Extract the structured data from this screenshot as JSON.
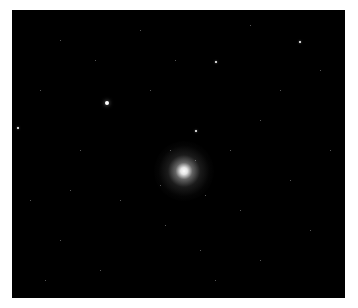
{
  "image": {
    "subject": "globular star cluster in dark sky field",
    "background_color": "#000000",
    "frame_color": "#ffffff",
    "cluster_center": [
      184,
      171
    ],
    "bright_stars": [
      {
        "x": 107,
        "y": 103,
        "size": 4
      },
      {
        "x": 196,
        "y": 131,
        "size": 2
      },
      {
        "x": 216,
        "y": 62,
        "size": 2
      },
      {
        "x": 300,
        "y": 42,
        "size": 2
      },
      {
        "x": 18,
        "y": 128,
        "size": 2
      }
    ],
    "faint_stars": [
      [
        60,
        40
      ],
      [
        140,
        30
      ],
      [
        250,
        25
      ],
      [
        320,
        70
      ],
      [
        40,
        90
      ],
      [
        80,
        150
      ],
      [
        120,
        200
      ],
      [
        60,
        240
      ],
      [
        100,
        270
      ],
      [
        200,
        250
      ],
      [
        240,
        210
      ],
      [
        290,
        180
      ],
      [
        310,
        230
      ],
      [
        260,
        120
      ],
      [
        230,
        150
      ],
      [
        150,
        90
      ],
      [
        70,
        190
      ],
      [
        30,
        200
      ],
      [
        280,
        90
      ],
      [
        175,
        60
      ],
      [
        330,
        150
      ],
      [
        215,
        280
      ],
      [
        95,
        60
      ],
      [
        260,
        260
      ],
      [
        45,
        280
      ],
      [
        165,
        225
      ],
      [
        205,
        195
      ],
      [
        170,
        150
      ],
      [
        195,
        160
      ],
      [
        160,
        185
      ]
    ]
  }
}
